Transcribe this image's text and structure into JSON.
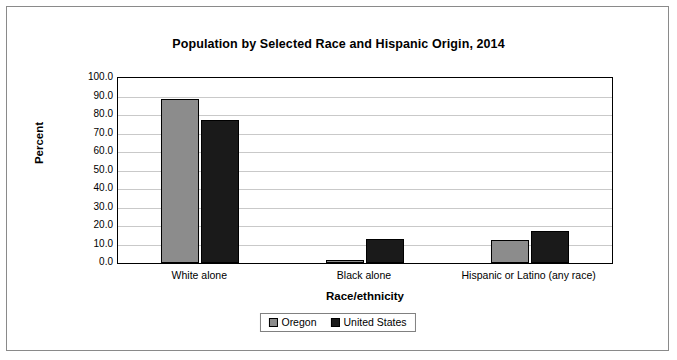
{
  "chart_data": {
    "type": "bar",
    "title": "Population by Selected Race and Hispanic Origin, 2014",
    "xlabel": "Race/ethnicity",
    "ylabel": "Percent",
    "categories": [
      "White alone",
      "Black alone",
      "Hispanic or Latino (any race)"
    ],
    "series": [
      {
        "name": "Oregon",
        "color": "#8c8c8c",
        "values": [
          88.5,
          1.9,
          12.4
        ]
      },
      {
        "name": "United States",
        "color": "#1a1a1a",
        "values": [
          77.4,
          13.2,
          17.4
        ]
      }
    ],
    "ylim": [
      0,
      100
    ],
    "yticks": [
      "100.0",
      "90.0",
      "80.0",
      "70.0",
      "60.0",
      "50.0",
      "40.0",
      "30.0",
      "20.0",
      "10.0",
      "0.0"
    ],
    "grid": true,
    "legend_position": "bottom"
  }
}
